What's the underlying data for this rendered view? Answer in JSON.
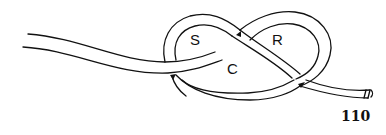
{
  "figure": {
    "type": "knot-diagram",
    "region_labels": [
      "S",
      "C",
      "R"
    ],
    "figure_number": "110"
  }
}
